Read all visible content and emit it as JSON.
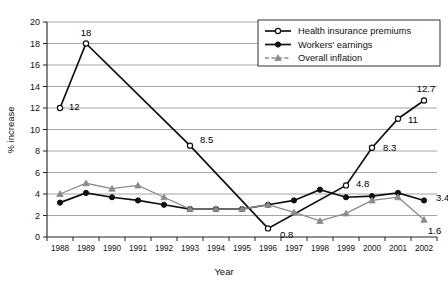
{
  "chart_data": {
    "type": "line",
    "title": "",
    "xlabel": "Year",
    "ylabel": "% increase",
    "ylim": [
      0,
      20
    ],
    "ytick_step": 2,
    "grid": true,
    "legend_position": "top-right",
    "categories": [
      "1988",
      "1989",
      "1990",
      "1991",
      "1992",
      "1993",
      "1994",
      "1995",
      "1996",
      "1997",
      "1998",
      "1999",
      "2000",
      "2001",
      "2002"
    ],
    "yticks": [
      "0",
      "2",
      "4",
      "6",
      "8",
      "10",
      "12",
      "14",
      "16",
      "18",
      "20"
    ],
    "series": [
      {
        "name": "Health insurance premiums",
        "marker": "open-circle",
        "color": "#111111",
        "values": [
          12,
          18,
          null,
          null,
          null,
          8.5,
          null,
          null,
          0.8,
          null,
          null,
          4.8,
          8.3,
          11,
          12.7
        ]
      },
      {
        "name": "Workers' earnings",
        "marker": "filled-circle",
        "color": "#111111",
        "values": [
          3.2,
          4.1,
          3.7,
          3.4,
          3.0,
          2.6,
          2.6,
          2.6,
          3.0,
          3.4,
          4.4,
          3.7,
          3.8,
          4.1,
          3.4
        ]
      },
      {
        "name": "Overall inflation",
        "marker": "triangle",
        "color": "#8a8a8a",
        "values": [
          4.0,
          5.0,
          4.5,
          4.8,
          3.7,
          2.6,
          2.6,
          2.6,
          3.0,
          2.3,
          1.5,
          2.2,
          3.4,
          3.7,
          1.6
        ]
      }
    ],
    "point_labels": [
      {
        "text": "12",
        "series": "Health insurance premiums",
        "category": "1988"
      },
      {
        "text": "18",
        "series": "Health insurance premiums",
        "category": "1989"
      },
      {
        "text": "8.5",
        "series": "Health insurance premiums",
        "category": "1993"
      },
      {
        "text": "0.8",
        "series": "Health insurance premiums",
        "category": "1996"
      },
      {
        "text": "4.8",
        "series": "Health insurance premiums",
        "category": "1999"
      },
      {
        "text": "8.3",
        "series": "Health insurance premiums",
        "category": "2000"
      },
      {
        "text": "11",
        "series": "Health insurance premiums",
        "category": "2001"
      },
      {
        "text": "12.7",
        "series": "Health insurance premiums",
        "category": "2002"
      },
      {
        "text": "3.4",
        "series": "Workers' earnings",
        "category": "2002"
      },
      {
        "text": "1.6",
        "series": "Overall inflation",
        "category": "2002"
      }
    ],
    "legend": [
      {
        "label": "Health insurance premiums",
        "marker": "open-circle",
        "color": "#111111"
      },
      {
        "label": "Workers' earnings",
        "marker": "filled-circle",
        "color": "#111111"
      },
      {
        "label": "Overall inflation",
        "marker": "triangle",
        "color": "#8a8a8a"
      }
    ]
  }
}
